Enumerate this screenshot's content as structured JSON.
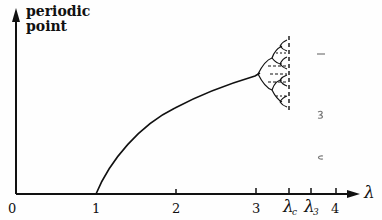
{
  "diagram": {
    "type": "bifurcation-sketch",
    "y_axis_label_line1": "periodic",
    "y_axis_label_line2": "point",
    "x_axis_label": "λ",
    "ticks": [
      {
        "label": "0",
        "x": 18
      },
      {
        "label": "1",
        "x": 96
      },
      {
        "label": "2",
        "x": 176
      },
      {
        "label": "3",
        "x": 256
      },
      {
        "label": "λ",
        "sub": "c",
        "x": 289
      },
      {
        "label": "λ",
        "sub": "3",
        "x": 311
      },
      {
        "label": "4",
        "x": 336
      }
    ],
    "curve": "fixed point branch rising from λ=1, period-doubling cascade near λ=3 accumulating at λc (dashed)",
    "colors": {
      "ink": "#111111",
      "paper": "#fefefe"
    }
  }
}
